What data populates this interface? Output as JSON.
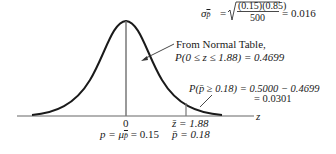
{
  "diagram": {
    "type": "normal-distribution-curve",
    "axis": {
      "label": "z",
      "ticks": [
        {
          "z": "0",
          "p": "p = μ_p̄ = 0.15"
        },
        {
          "z": "z̄ = 1.88",
          "p": "p̄ = 0.18"
        }
      ]
    },
    "std_error": {
      "symbol": "σ",
      "subscript": "p̄",
      "numerator": "(0.15)(0.85)",
      "denominator": "500",
      "result": "= 0.016"
    },
    "annotation_area": {
      "line1": "From Normal Table,",
      "line2": "P(0 ≤ z ≤ 1.88) = 0.4699"
    },
    "annotation_tail": {
      "line1": "P(p̄ ≥ 0.18) = 0.5000 − 0.4699",
      "line2": "= 0.0301"
    },
    "labels": {
      "zero": "0",
      "mean_prefix": "p = μ",
      "mean_sub": "p̄",
      "mean_val": " = 0.15",
      "zbar": "z̄ = 1.88",
      "pbar": "p̄ = 0.18",
      "axis_z": "z"
    },
    "colors": {
      "curve": "#1a1a1a",
      "line": "#555555"
    }
  }
}
